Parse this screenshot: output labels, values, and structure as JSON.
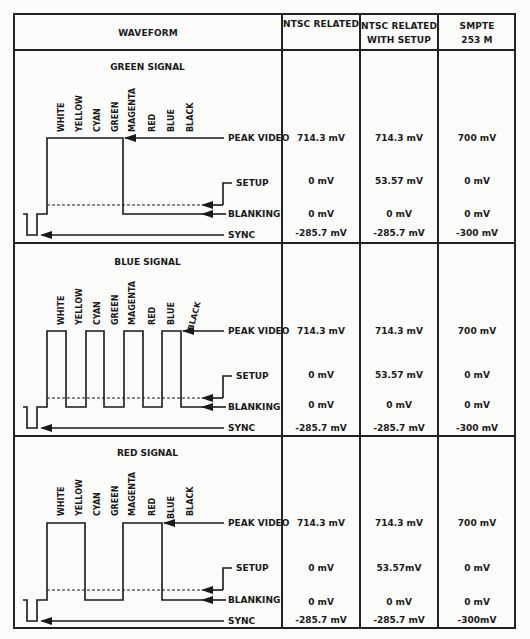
{
  "header": {
    "waveform": "WAVEFORM",
    "ntsc_related": "NTSC RELATED",
    "ntsc_setup_line1": "NTSC RELATED",
    "ntsc_setup_line2": "WITH SETUP",
    "smpte_line1": "SMPTE",
    "smpte_line2": "253 M"
  },
  "bar_labels": [
    "WHITE",
    "YELLOW",
    "CYAN",
    "GREEN",
    "MAGENTA",
    "RED",
    "BLUE",
    "BLACK"
  ],
  "level_labels": {
    "peak": "PEAK VIDEO",
    "setup": "SETUP",
    "blanking": "BLANKING",
    "sync": "SYNC"
  },
  "rows": [
    {
      "title": "GREEN SIGNAL",
      "ntsc": {
        "peak": "714.3 mV",
        "setup": "0 mV",
        "blanking": "0 mV",
        "sync": "-285.7 mV"
      },
      "ntsc_setup": {
        "peak": "714.3 mV",
        "setup": "53.57 mV",
        "blanking": "0 mV",
        "sync": "-285.7 mV"
      },
      "smpte": {
        "peak": "700 mV",
        "setup": "0 mV",
        "blanking": "0 mV",
        "sync": "-300 mV"
      }
    },
    {
      "title": "BLUE SIGNAL",
      "ntsc": {
        "peak": "714.3 mV",
        "setup": "0 mV",
        "blanking": "0 mV",
        "sync": "-285.7 mV"
      },
      "ntsc_setup": {
        "peak": "714.3 mV",
        "setup": "53.57 mV",
        "blanking": "0 mV",
        "sync": "-285.7 mV"
      },
      "smpte": {
        "peak": "700 mV",
        "setup": "0 mV",
        "blanking": "0 mV",
        "sync": "-300 mV"
      }
    },
    {
      "title": "RED SIGNAL",
      "ntsc": {
        "peak": "714.3 mV",
        "setup": "0 mV",
        "blanking": "0 mV",
        "sync": "-285.7 mV"
      },
      "ntsc_setup": {
        "peak": "714.3 mV",
        "setup": "53.57mV",
        "blanking": "0 mV",
        "sync": "-285.7 mV"
      },
      "smpte": {
        "peak": "700 mV",
        "setup": "0 mV",
        "blanking": "0 mV",
        "sync": "-300mV"
      }
    }
  ],
  "colors": {
    "ink": "#1a1a1a",
    "paper": "#fbfbfa"
  }
}
